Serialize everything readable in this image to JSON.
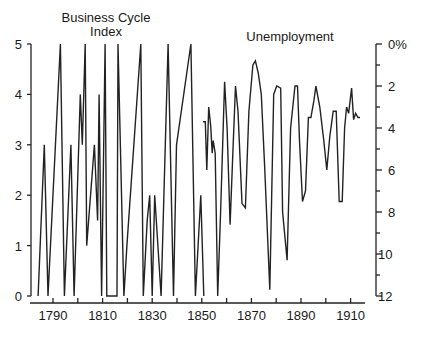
{
  "chart_data": [
    {
      "type": "line",
      "title": "Business Cycle Index",
      "title_lines": [
        "Business Cycle",
        "Index"
      ],
      "xlabel": "",
      "ylabel": "",
      "axis_side": "left",
      "ylim": [
        0,
        5
      ],
      "yticks": [
        0,
        1,
        2,
        3,
        4,
        5
      ],
      "xlim": [
        1778,
        1916
      ],
      "xticks": [
        1790,
        1800,
        1810,
        1820,
        1830,
        1840,
        1850,
        1860,
        1870,
        1880,
        1890,
        1900,
        1910
      ],
      "xtick_labels": [
        "1790",
        "1810",
        "1830",
        "1850",
        "1870",
        "1890",
        "1910"
      ],
      "series": [
        {
          "name": "Business Cycle Index",
          "x": [
            1784,
            1786.5,
            1788,
            1793,
            1794.6,
            1797.2,
            1798.5,
            1801,
            1801.8,
            1803,
            1803.6,
            1806.7,
            1808,
            1808.6,
            1809.6,
            1811,
            1811.7,
            1815.8,
            1816.2,
            1818.6,
            1819.8,
            1825.4,
            1826.4,
            1828,
            1829,
            1830,
            1831,
            1833.6,
            1836.4,
            1838.6,
            1839.8,
            1845.6,
            1847.4,
            1849.6,
            1850.8
          ],
          "y": [
            0,
            3,
            0,
            5,
            0,
            3,
            0,
            4,
            3,
            5,
            1,
            3,
            1.5,
            4,
            0,
            5,
            0,
            0,
            5,
            0,
            1,
            5,
            0,
            1.5,
            2,
            0,
            2,
            0,
            5,
            0,
            3,
            5,
            0,
            2,
            0
          ]
        }
      ]
    },
    {
      "type": "line",
      "title": "Unemployment",
      "xlabel": "",
      "ylabel": "",
      "axis_side": "right",
      "y_inverted": true,
      "ylim": [
        12,
        0
      ],
      "yticks": [
        0,
        2,
        4,
        6,
        8,
        10,
        12
      ],
      "ytick_labels": [
        "0%",
        "2",
        "4",
        "6",
        "8",
        "10",
        "12"
      ],
      "series": [
        {
          "name": "Unemployment (%)",
          "x": [
            1850.5,
            1851.4,
            1852,
            1852.8,
            1853.6,
            1854.2,
            1854.6,
            1855.4,
            1856.4,
            1857.6,
            1859.2,
            1860.2,
            1861.4,
            1862.6,
            1863.6,
            1864.6,
            1866.2,
            1867.6,
            1869,
            1870.6,
            1871.6,
            1872.8,
            1874,
            1875.4,
            1877.4,
            1879,
            1880.2,
            1881.8,
            1882.6,
            1884.4,
            1885.8,
            1887.6,
            1888.6,
            1889.4,
            1890.6,
            1891.8,
            1893,
            1894,
            1895.2,
            1896,
            1897.6,
            1899.2,
            1900.4,
            1901.6,
            1903,
            1904.2,
            1905.4,
            1906.6,
            1907.6,
            1908.4,
            1909.2,
            1910.4,
            1911.2,
            1912,
            1913,
            1913.8
          ],
          "y": [
            3.7,
            3.7,
            6.0,
            3.0,
            3.9,
            5.2,
            4.6,
            5.2,
            12.0,
            8.0,
            1.8,
            4.0,
            8.6,
            5.0,
            2.0,
            3.2,
            7.6,
            7.8,
            3.2,
            1.0,
            0.8,
            1.4,
            2.4,
            6.0,
            11.7,
            2.4,
            2.0,
            2.1,
            8.0,
            10.3,
            4.0,
            2.0,
            2.0,
            4.6,
            7.5,
            7.0,
            3.5,
            3.5,
            2.7,
            2.0,
            3.0,
            4.6,
            6.0,
            4.4,
            3.2,
            3.2,
            7.5,
            7.5,
            4.0,
            3.0,
            3.3,
            2.1,
            3.6,
            3.3,
            3.5,
            3.5
          ]
        }
      ]
    }
  ],
  "labels": {
    "left_title_line1": "Business Cycle",
    "left_title_line2": "Index",
    "right_title": "Unemployment",
    "left_ticks": [
      "0",
      "1",
      "2",
      "3",
      "4",
      "5"
    ],
    "right_ticks": [
      "0%",
      "2",
      "4",
      "6",
      "8",
      "10",
      "12"
    ],
    "x_ticks": [
      "1790",
      "1810",
      "1830",
      "1850",
      "1870",
      "1890",
      "1910"
    ]
  },
  "colors": {
    "line": "#222222",
    "axis": "#222222",
    "background": "#ffffff"
  }
}
